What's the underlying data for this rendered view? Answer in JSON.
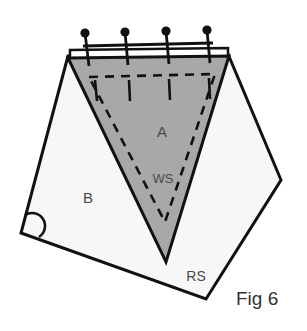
{
  "figure": {
    "caption": "Fig 6",
    "title": "Sewing pattern diagram: triangular piece A pinned to piece B",
    "background_color": "#ffffff",
    "labels": [
      {
        "id": "piece-a",
        "text": "A",
        "x": 162,
        "y": 137,
        "font_size": 15,
        "color": "#4a4a4a"
      },
      {
        "id": "wrong-side",
        "text": "WS",
        "x": 163,
        "y": 183,
        "font_size": 13,
        "color": "#4a4a4a"
      },
      {
        "id": "piece-b",
        "text": "B",
        "x": 88,
        "y": 203,
        "font_size": 15,
        "color": "#4a4a4a"
      },
      {
        "id": "right-side",
        "text": "RS",
        "x": 196,
        "y": 281,
        "font_size": 14,
        "color": "#4a4a4a"
      }
    ],
    "shapes": {
      "base_piece_b": {
        "name": "piece-b-outline",
        "fill": "#f7f7f7",
        "stroke": "#111111",
        "stroke_width": 3,
        "points": "68,56 21,233 206,299 281,180 228,54"
      },
      "top_band": {
        "name": "seam-allowance-band",
        "fill": "#ffffff",
        "stroke": "#111111",
        "stroke_width": 2.5,
        "points": "70,50 228,48 228,58 70,60"
      },
      "triangle_a": {
        "name": "triangle-piece-a",
        "fill": "#a8a8a8",
        "stroke": "#111111",
        "stroke_width": 3,
        "points": "68,58 229,56 166,262"
      },
      "stitch_line": {
        "name": "basting-stitch-line",
        "stroke": "#111111",
        "stroke_width": 2.6,
        "dash": "9,7",
        "points": "89,77 215,74 165,222"
      }
    },
    "pins": [
      {
        "id": "pin-1",
        "head_x": 85,
        "head_y": 33,
        "tip_x": 89,
        "tip_y": 66,
        "head_r": 4.6
      },
      {
        "id": "pin-2",
        "head_x": 125,
        "head_y": 32,
        "tip_x": 128,
        "tip_y": 65,
        "head_r": 4.6
      },
      {
        "id": "pin-3",
        "head_x": 166,
        "head_y": 31,
        "tip_x": 169,
        "tip_y": 64,
        "head_r": 4.6
      },
      {
        "id": "pin-4",
        "head_x": 207,
        "head_y": 30,
        "tip_x": 210,
        "tip_y": 63,
        "head_r": 4.6
      }
    ],
    "pin_rail": {
      "name": "pin-alignment-rail",
      "x1": 83,
      "y1": 46,
      "x2": 213,
      "y2": 43
    },
    "tick_marks": [
      {
        "id": "tick-1",
        "x1": 95,
        "y1": 80,
        "x2": 97,
        "y2": 101
      },
      {
        "id": "tick-2",
        "x1": 129,
        "y1": 80,
        "x2": 130,
        "y2": 101
      },
      {
        "id": "tick-3",
        "x1": 169,
        "y1": 79,
        "x2": 170,
        "y2": 100
      },
      {
        "id": "tick-4",
        "x1": 209,
        "y1": 78,
        "x2": 210,
        "y2": 99
      }
    ],
    "angle_mark": {
      "name": "right-angle-arc",
      "description": "semicircular angle arc at lower-left corner of piece B",
      "path": "M 25,215 A 11,11 0 0 1 39,237",
      "stroke": "#111111",
      "stroke_width": 2.6
    },
    "caption_position": {
      "x": 236,
      "y": 305,
      "font_size": 19
    }
  }
}
